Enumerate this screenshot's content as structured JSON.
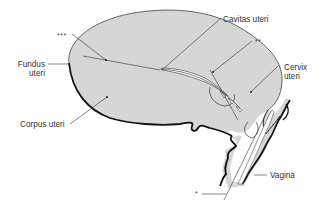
{
  "diagram": {
    "type": "anatomical-illustration",
    "colors": {
      "tissue_fill": "#d6d6d6",
      "outline": "#1a1a1a",
      "leader_line": "#333333",
      "lumen": "#ffffff",
      "background": "#ffffff"
    },
    "labels": {
      "triple_star": "***",
      "double_star": "**",
      "single_star": "*",
      "fundus_line1": "Fundus",
      "fundus_line2": "uteri",
      "cavitas": "Cavitas uteri",
      "cervix_line1": "Cervix",
      "cervix_line2": "uteri",
      "corpus": "Corpus uteri",
      "vagina": "Vagina"
    }
  }
}
